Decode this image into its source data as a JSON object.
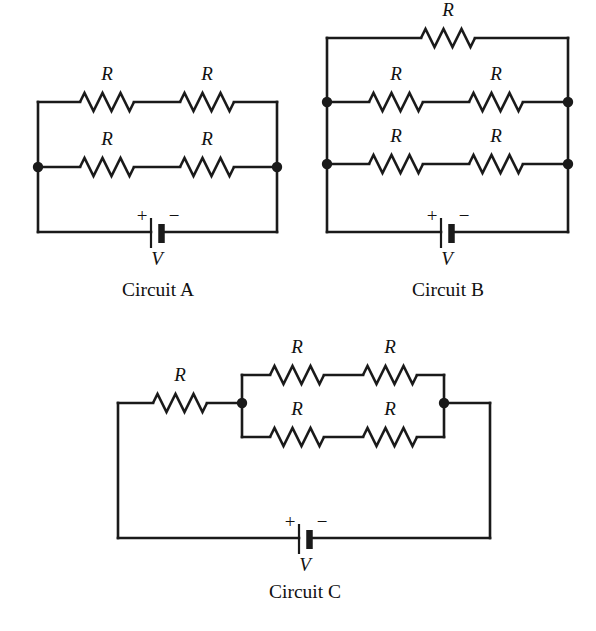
{
  "figure": {
    "width": 596,
    "height": 631,
    "background_color": "#ffffff",
    "line_color": "#1a1a1a",
    "text_color": "#111111"
  },
  "labels": {
    "resistor": "R",
    "voltage": "V",
    "plus": "+",
    "minus": "−"
  },
  "circuits": [
    {
      "id": "circuit-a",
      "caption": "Circuit A",
      "caption_x": 158,
      "caption_y": 296,
      "description": "Two parallel branches, each with two resistors in series, connected to a battery",
      "resistor_count": 4,
      "battery_count": 1,
      "resistors": [
        {
          "name": "circuit-a-resistor-top-left",
          "label": "R",
          "cx": 107,
          "cy": 102,
          "label_x": 107,
          "label_y": 80
        },
        {
          "name": "circuit-a-resistor-top-right",
          "label": "R",
          "cx": 207,
          "cy": 102,
          "label_x": 207,
          "label_y": 80
        },
        {
          "name": "circuit-a-resistor-mid-left",
          "label": "R",
          "cx": 107,
          "cy": 167,
          "label_x": 107,
          "label_y": 145
        },
        {
          "name": "circuit-a-resistor-mid-right",
          "label": "R",
          "cx": 207,
          "cy": 167,
          "label_x": 207,
          "label_y": 145
        }
      ],
      "nodes": [
        {
          "name": "circuit-a-node-left",
          "cx": 38,
          "cy": 167
        },
        {
          "name": "circuit-a-node-right",
          "cx": 277,
          "cy": 167
        }
      ],
      "battery": {
        "name": "circuit-a-battery",
        "x": 157,
        "y": 232,
        "label": "V",
        "label_x": 157,
        "label_y": 265,
        "plus_x": 142,
        "plus_y": 222,
        "minus_x": 174,
        "minus_y": 222
      }
    },
    {
      "id": "circuit-b",
      "caption": "Circuit B",
      "caption_x": 448,
      "caption_y": 296,
      "description": "Three parallel branches: top branch with one resistor, two branches with two resistors each, connected to a battery",
      "resistor_count": 5,
      "battery_count": 1,
      "resistors": [
        {
          "name": "circuit-b-resistor-top",
          "label": "R",
          "cx": 448,
          "cy": 38,
          "label_x": 448,
          "label_y": 16
        },
        {
          "name": "circuit-b-resistor-mid-left",
          "label": "R",
          "cx": 396,
          "cy": 102,
          "label_x": 396,
          "label_y": 80
        },
        {
          "name": "circuit-b-resistor-mid-right",
          "label": "R",
          "cx": 496,
          "cy": 102,
          "label_x": 496,
          "label_y": 80
        },
        {
          "name": "circuit-b-resistor-low-left",
          "label": "R",
          "cx": 396,
          "cy": 164,
          "label_x": 396,
          "label_y": 142
        },
        {
          "name": "circuit-b-resistor-low-right",
          "label": "R",
          "cx": 496,
          "cy": 164,
          "label_x": 496,
          "label_y": 142
        }
      ],
      "nodes": [
        {
          "name": "circuit-b-node-top-left",
          "cx": 327,
          "cy": 102
        },
        {
          "name": "circuit-b-node-top-right",
          "cx": 568,
          "cy": 102
        },
        {
          "name": "circuit-b-node-bottom-left",
          "cx": 327,
          "cy": 164
        },
        {
          "name": "circuit-b-node-bottom-right",
          "cx": 568,
          "cy": 164
        }
      ],
      "battery": {
        "name": "circuit-b-battery",
        "x": 447,
        "y": 232,
        "label": "V",
        "label_x": 447,
        "label_y": 265,
        "plus_x": 432,
        "plus_y": 222,
        "minus_x": 464,
        "minus_y": 222
      }
    },
    {
      "id": "circuit-c",
      "caption": "Circuit C",
      "caption_x": 305,
      "caption_y": 598,
      "description": "One resistor in series with a parallel block of two branches, each having two resistors in series, connected to a battery",
      "resistor_count": 5,
      "battery_count": 1,
      "resistors": [
        {
          "name": "circuit-c-resistor-series",
          "label": "R",
          "cx": 180,
          "cy": 403,
          "label_x": 180,
          "label_y": 381
        },
        {
          "name": "circuit-c-resistor-top-left",
          "label": "R",
          "cx": 297,
          "cy": 375,
          "label_x": 297,
          "label_y": 353
        },
        {
          "name": "circuit-c-resistor-top-right",
          "label": "R",
          "cx": 390,
          "cy": 375,
          "label_x": 390,
          "label_y": 353
        },
        {
          "name": "circuit-c-resistor-bottom-left",
          "label": "R",
          "cx": 297,
          "cy": 437,
          "label_x": 297,
          "label_y": 415
        },
        {
          "name": "circuit-c-resistor-bottom-right",
          "label": "R",
          "cx": 390,
          "cy": 437,
          "label_x": 390,
          "label_y": 415
        }
      ],
      "nodes": [
        {
          "name": "circuit-c-node-left",
          "cx": 242,
          "cy": 403
        },
        {
          "name": "circuit-c-node-right",
          "cx": 444,
          "cy": 403
        }
      ],
      "battery": {
        "name": "circuit-c-battery",
        "x": 305,
        "y": 538,
        "label": "V",
        "label_x": 305,
        "label_y": 571,
        "plus_x": 290,
        "plus_y": 528,
        "minus_x": 322,
        "minus_y": 528
      }
    }
  ]
}
